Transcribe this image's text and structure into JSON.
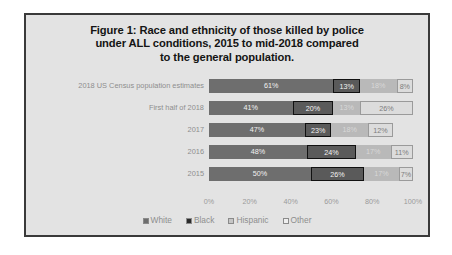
{
  "chart_data": {
    "type": "bar",
    "orientation": "horizontal",
    "stacked": true,
    "title": "Figure 1: Race and ethnicity of those killed by police under ALL conditions, 2015 to mid-2018 compared to the general population.",
    "title_lines": [
      "Figure 1: Race and ethnicity of those killed by police",
      "under ALL conditions, 2015 to mid-2018 compared",
      "to the general population."
    ],
    "categories": [
      "2018 US Census population estimates",
      "First half of 2018",
      "2017",
      "2016",
      "2015"
    ],
    "series": [
      {
        "name": "White",
        "values": [
          61,
          41,
          47,
          48,
          50
        ],
        "color": "#6e6e6e"
      },
      {
        "name": "Black",
        "values": [
          13,
          20,
          13,
          24,
          26
        ],
        "color": "#5a5a5a"
      },
      {
        "name": "Hispanic",
        "values": [
          18,
          13,
          18,
          17,
          17
        ],
        "color": "#b9b9b9"
      },
      {
        "name": "Other",
        "values": [
          8,
          26,
          12,
          11,
          7
        ],
        "color": "#dcdcdc"
      }
    ],
    "data_labels": [
      [
        "61%",
        "13%",
        "18%",
        "8%"
      ],
      [
        "41%",
        "20%",
        "13%",
        "26%"
      ],
      [
        "47%",
        "23%",
        "18%",
        "12%"
      ],
      [
        "48%",
        "24%",
        "17%",
        "11%"
      ],
      [
        "50%",
        "26%",
        "17%",
        "7%"
      ]
    ],
    "xlabel": "",
    "ylabel": "",
    "xlim": [
      0,
      100
    ],
    "xticks": [
      0,
      20,
      40,
      60,
      80,
      100
    ],
    "xtick_labels": [
      "0%",
      "20%",
      "40%",
      "60%",
      "80%",
      "100%"
    ],
    "grid": false,
    "legend_position": "bottom",
    "legend": [
      "White",
      "Black",
      "Hispanic",
      "Other"
    ],
    "highlight_series": "Black",
    "highlight_note": "Black segments are outlined with a heavy dark border"
  },
  "figure": {
    "background_color": "#e3e3e3",
    "border_color": "#3a3a3a"
  }
}
